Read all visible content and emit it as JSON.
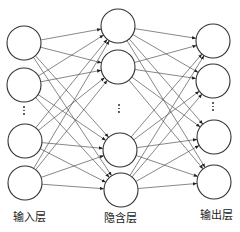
{
  "diagram": {
    "title": "",
    "type": "feedforward-neural-network",
    "layers": [
      {
        "id": "input",
        "label": "输入层",
        "label_x": 29,
        "label_y": 208,
        "nodes": [
          [
            24,
            43
          ],
          [
            24,
            85
          ],
          [
            25,
            141
          ],
          [
            25,
            183
          ]
        ],
        "ellipsis": {
          "x": 24,
          "y": 106
        }
      },
      {
        "id": "hidden",
        "label": "隐含层",
        "label_x": 120,
        "label_y": 209,
        "nodes": [
          [
            118,
            26
          ],
          [
            118,
            67
          ],
          [
            120,
            150
          ],
          [
            121,
            190
          ]
        ],
        "ellipsis": {
          "x": 119,
          "y": 104
        }
      },
      {
        "id": "output",
        "label": "输出层",
        "label_x": 216,
        "label_y": 206,
        "nodes": [
          [
            213,
            41
          ],
          [
            213,
            81
          ],
          [
            214,
            137
          ],
          [
            214,
            182
          ]
        ],
        "ellipsis": {
          "x": 213,
          "y": 102
        }
      }
    ],
    "node_radius": 17,
    "node_stroke": "#333333",
    "edge_stroke": "#555555",
    "connections": "fully-connected with arrows from each layer to the next"
  }
}
